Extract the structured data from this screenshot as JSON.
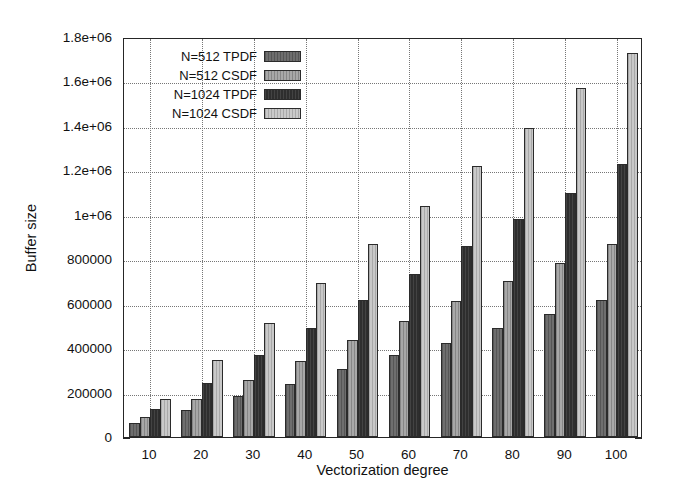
{
  "chart_data": {
    "type": "bar",
    "title": "",
    "xlabel": "Vectorization degree",
    "ylabel": "Buffer size",
    "categories": [
      "10",
      "20",
      "30",
      "40",
      "50",
      "60",
      "70",
      "80",
      "90",
      "100"
    ],
    "ylim": [
      0,
      1800000
    ],
    "xlim": [
      5,
      105
    ],
    "grid": true,
    "legend_position": "top-left-inside",
    "ytick_labels": [
      "0",
      "200000",
      "400000",
      "600000",
      "800000",
      "1e+06",
      "1.2e+06",
      "1.4e+06",
      "1.6e+06",
      "1.8e+06"
    ],
    "ytick_values": [
      0,
      200000,
      400000,
      600000,
      800000,
      1000000,
      1200000,
      1400000,
      1600000,
      1800000
    ],
    "xtick_labels": [
      "10",
      "20",
      "30",
      "40",
      "50",
      "60",
      "70",
      "80",
      "90",
      "100"
    ],
    "xtick_values": [
      10,
      20,
      30,
      40,
      50,
      60,
      70,
      80,
      90,
      100
    ],
    "series": [
      {
        "name": "N=512 TPDF",
        "color": "#6e6e6e",
        "fill": "fill-s0",
        "values": [
          63000,
          120000,
          185000,
          240000,
          305000,
          370000,
          425000,
          490000,
          555000,
          615000
        ]
      },
      {
        "name": "N=512 CSDF",
        "color": "#a8a8a8",
        "fill": "fill-s1",
        "values": [
          90000,
          170000,
          255000,
          340000,
          435000,
          520000,
          610000,
          700000,
          785000,
          870000
        ]
      },
      {
        "name": "N=1024 TPDF",
        "color": "#2e2e2e",
        "fill": "fill-s2",
        "values": [
          127000,
          245000,
          370000,
          490000,
          615000,
          735000,
          860000,
          980000,
          1100000,
          1230000
        ]
      },
      {
        "name": "N=1024 CSDF",
        "color": "#c9c9c9",
        "fill": "fill-s3",
        "values": [
          172000,
          345000,
          515000,
          695000,
          870000,
          1040000,
          1220000,
          1390000,
          1570000,
          1730000
        ]
      }
    ]
  },
  "axes": {
    "ylabel": "Buffer size",
    "xlabel": "Vectorization degree"
  }
}
